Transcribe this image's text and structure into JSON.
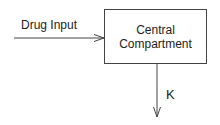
{
  "diagram": {
    "nodes": [
      {
        "id": "central",
        "label_line1": "Central",
        "label_line2": "Compartment"
      }
    ],
    "edges": [
      {
        "from": "external",
        "to": "central",
        "label": "Drug Input"
      },
      {
        "from": "central",
        "to": "elimination",
        "label": "K"
      }
    ]
  },
  "labels": {
    "input": "Drug Input",
    "box_line1": "Central",
    "box_line2": "Compartment",
    "elimination": "K"
  }
}
